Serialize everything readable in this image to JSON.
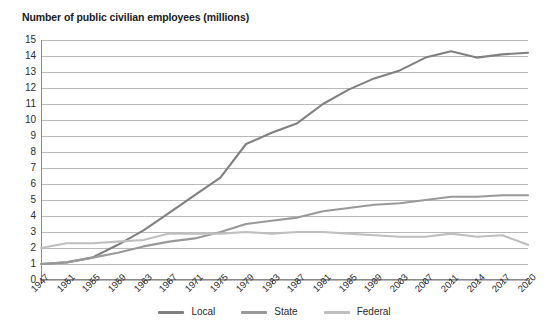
{
  "chart_data": {
    "type": "line",
    "title": "Number of public civilian employees (millions)",
    "xlabel": "",
    "ylabel": "",
    "ylim": [
      0,
      15
    ],
    "ytick_step": 1,
    "grid": true,
    "legend_position": "bottom",
    "x": [
      "1947",
      "1951",
      "1955",
      "1959",
      "1963",
      "1967",
      "1971",
      "1975",
      "1979",
      "1983",
      "1987",
      "1991",
      "1995",
      "1999",
      "2003",
      "2007",
      "2011",
      "2014",
      "2017",
      "2020"
    ],
    "ytick_labels": [
      "15",
      "14",
      "13",
      "12",
      "11",
      "10",
      "9",
      "8",
      "7",
      "6",
      "5",
      "4",
      "3",
      "2",
      "1",
      "0"
    ],
    "series": [
      {
        "name": "Local",
        "color": "#808080",
        "values": [
          1.0,
          1.1,
          1.4,
          2.2,
          3.1,
          4.2,
          5.3,
          6.4,
          8.5,
          9.2,
          9.8,
          11.0,
          11.9,
          12.6,
          13.1,
          13.9,
          14.3,
          13.9,
          14.1,
          14.2
        ]
      },
      {
        "name": "State",
        "color": "#999999",
        "values": [
          1.0,
          1.1,
          1.4,
          1.7,
          2.1,
          2.4,
          2.6,
          3.0,
          3.5,
          3.7,
          3.9,
          4.3,
          4.5,
          4.7,
          4.8,
          5.0,
          5.2,
          5.2,
          5.3,
          5.3
        ]
      },
      {
        "name": "Federal",
        "color": "#bfbfbf",
        "values": [
          2.0,
          2.3,
          2.3,
          2.4,
          2.5,
          2.9,
          2.9,
          2.9,
          3.0,
          2.9,
          3.0,
          3.0,
          2.9,
          2.8,
          2.7,
          2.7,
          2.9,
          2.7,
          2.8,
          2.2
        ]
      }
    ]
  },
  "legend": {
    "items": [
      {
        "label": "Local",
        "color": "#808080"
      },
      {
        "label": "State",
        "color": "#999999"
      },
      {
        "label": "Federal",
        "color": "#bfbfbf"
      }
    ]
  }
}
